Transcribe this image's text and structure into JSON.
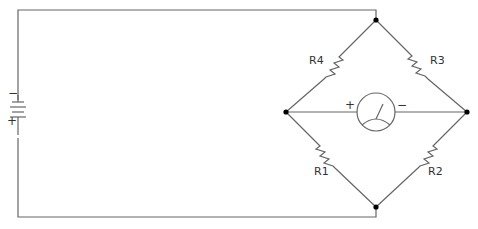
{
  "diagram": {
    "battery": {
      "neg_sign": "−",
      "pos_sign": "+"
    },
    "resistors": [
      {
        "id": "R4",
        "label": "R4"
      },
      {
        "id": "R3",
        "label": "R3"
      },
      {
        "id": "R1",
        "label": "R1"
      },
      {
        "id": "R2",
        "label": "R2"
      }
    ],
    "meter": {
      "pos_sign": "+",
      "neg_sign": "−"
    },
    "colors": {
      "wire": "#666666",
      "node": "#000000",
      "text": "#333333"
    }
  }
}
